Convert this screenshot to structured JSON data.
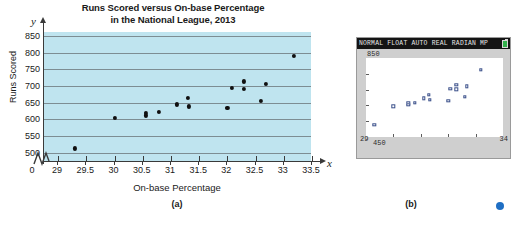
{
  "figure": {
    "panel_a": {
      "caption": "(a)",
      "title_line1": "Runs Scored versus On-base Percentage",
      "title_line2": "in the National League, 2013",
      "x_axis_title": "On-base Percentage",
      "y_axis_title": "Runs Scored",
      "x_var_symbol": "x",
      "y_var_symbol": "y",
      "origin_label": "0",
      "plot_background": "#bfe4ef",
      "point_color": "#101010",
      "gridline_color": "#7d8d93"
    },
    "panel_b": {
      "caption": "(b)",
      "status_bar": "NORMAL FLOAT AUTO REAL RADIAN MP",
      "battery_icon": "battery-icon",
      "y_max_label": "850",
      "y_min_label": "450",
      "x_min_label": "29",
      "x_max_label": "34",
      "screen_background": "#ffffff",
      "marker_color": "#3a4f8a",
      "status_bar_color": "#141414"
    }
  },
  "chart_data": {
    "type": "scatter",
    "title": "Runs Scored versus On-base Percentage in the National League, 2013",
    "xlabel": "On-base Percentage",
    "ylabel": "Runs Scored",
    "xlim": [
      28.75,
      33.5
    ],
    "ylim": [
      475,
      862
    ],
    "x_ticks": [
      29,
      29.5,
      30,
      30.5,
      31,
      31.5,
      32,
      32.5,
      33,
      33.5
    ],
    "x_tick_labels": [
      "29",
      "29.5",
      "30",
      "30.5",
      "31",
      "31.5",
      "32",
      "32.5",
      "33",
      "33.5"
    ],
    "y_ticks": [
      500,
      550,
      600,
      650,
      700,
      750,
      800,
      850
    ],
    "y_tick_labels": [
      "500",
      "550",
      "600",
      "650",
      "700",
      "750",
      "800",
      "850"
    ],
    "grid": true,
    "axis_break_x": true,
    "legend": "none",
    "points": [
      {
        "x": 29.3,
        "y": 513
      },
      {
        "x": 30.0,
        "y": 605
      },
      {
        "x": 30.55,
        "y": 620
      },
      {
        "x": 30.55,
        "y": 612
      },
      {
        "x": 30.78,
        "y": 622
      },
      {
        "x": 31.1,
        "y": 645
      },
      {
        "x": 31.3,
        "y": 664
      },
      {
        "x": 31.32,
        "y": 639
      },
      {
        "x": 32.0,
        "y": 634
      },
      {
        "x": 32.08,
        "y": 695
      },
      {
        "x": 32.3,
        "y": 714
      },
      {
        "x": 32.3,
        "y": 692
      },
      {
        "x": 32.6,
        "y": 655
      },
      {
        "x": 32.68,
        "y": 706
      },
      {
        "x": 33.18,
        "y": 790
      }
    ],
    "calculator_window": {
      "xmin": 29,
      "xmax": 34,
      "ymin": 450,
      "ymax": 850
    }
  }
}
